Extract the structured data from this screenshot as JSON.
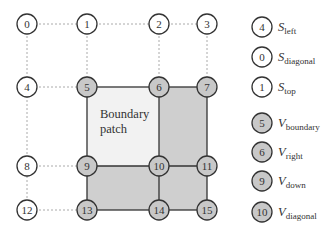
{
  "diagram": {
    "patch_label_line1": "Boundary",
    "patch_label_line2": "patch",
    "nodes": [
      {
        "id": "0",
        "x": 27,
        "y": 24,
        "shaded": false
      },
      {
        "id": "1",
        "x": 87,
        "y": 24,
        "shaded": false
      },
      {
        "id": "2",
        "x": 159,
        "y": 24,
        "shaded": false
      },
      {
        "id": "3",
        "x": 207,
        "y": 24,
        "shaded": false
      },
      {
        "id": "4",
        "x": 27,
        "y": 87,
        "shaded": false
      },
      {
        "id": "5",
        "x": 87,
        "y": 87,
        "shaded": true
      },
      {
        "id": "6",
        "x": 159,
        "y": 87,
        "shaded": true
      },
      {
        "id": "7",
        "x": 207,
        "y": 87,
        "shaded": true
      },
      {
        "id": "8",
        "x": 27,
        "y": 166,
        "shaded": false
      },
      {
        "id": "9",
        "x": 87,
        "y": 166,
        "shaded": true
      },
      {
        "id": "10",
        "x": 159,
        "y": 166,
        "shaded": true
      },
      {
        "id": "11",
        "x": 207,
        "y": 166,
        "shaded": true
      },
      {
        "id": "12",
        "x": 27,
        "y": 210,
        "shaded": false
      },
      {
        "id": "13",
        "x": 87,
        "y": 210,
        "shaded": true
      },
      {
        "id": "14",
        "x": 159,
        "y": 210,
        "shaded": true
      },
      {
        "id": "15",
        "x": 207,
        "y": 210,
        "shaded": true
      }
    ],
    "colors": {
      "node_fill_white": "#ffffff",
      "node_fill_shaded": "#c8c8c8",
      "patch_fill": "#f2f2f2",
      "shaded_region": "#cfcfcf",
      "line": "#333333",
      "dashed": "#aaaaaa"
    }
  },
  "legend": [
    {
      "node": "4",
      "symbol": "S",
      "sub": "left",
      "shaded": false
    },
    {
      "node": "0",
      "symbol": "S",
      "sub": "diagonal",
      "shaded": false
    },
    {
      "node": "1",
      "symbol": "S",
      "sub": "top",
      "shaded": false
    },
    {
      "node": "5",
      "symbol": "V",
      "sub": "boundary",
      "shaded": true
    },
    {
      "node": "6",
      "symbol": "V",
      "sub": "right",
      "shaded": true
    },
    {
      "node": "9",
      "symbol": "V",
      "sub": "down",
      "shaded": true
    },
    {
      "node": "10",
      "symbol": "V",
      "sub": "diagonal",
      "shaded": true
    }
  ]
}
